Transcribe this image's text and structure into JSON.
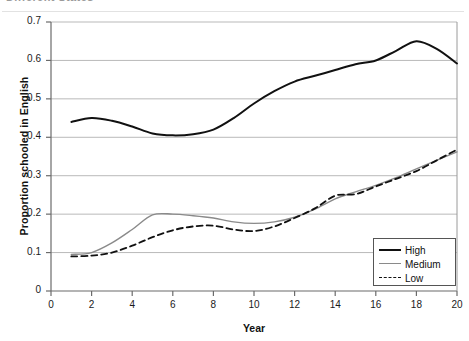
{
  "header": {
    "clipped_title": "Different States"
  },
  "legend": {
    "position": "bottom-right",
    "entries": [
      {
        "label": "High",
        "style": "solid-thick",
        "color": "#111111"
      },
      {
        "label": "Medium",
        "style": "solid-thin",
        "color": "#8a8a8a"
      },
      {
        "label": "Low",
        "style": "dashed",
        "color": "#111111"
      }
    ]
  },
  "axes": {
    "y_ticks": [
      "0.7",
      "0.6",
      "0.5",
      "0.4",
      "0.3",
      "0.2",
      "0.1",
      "0"
    ],
    "x_ticks": [
      "0",
      "2",
      "4",
      "6",
      "8",
      "10",
      "12",
      "14",
      "16",
      "18",
      "20"
    ]
  },
  "chart_data": {
    "type": "line",
    "title": "",
    "xlabel": "Year",
    "ylabel": "Proportion schooled in English",
    "xlim": [
      0,
      20
    ],
    "ylim": [
      0,
      0.7
    ],
    "ytick_step": 0.1,
    "xtick_step": 2,
    "grid": "horizontal",
    "legend_position": "bottom-right",
    "x": [
      1,
      2,
      3,
      4,
      5,
      6,
      7,
      8,
      9,
      10,
      11,
      12,
      13,
      14,
      15,
      16,
      17,
      18,
      19,
      20
    ],
    "series": [
      {
        "name": "High",
        "color": "#111111",
        "style": "solid",
        "width": 2,
        "values": [
          0.44,
          0.45,
          0.443,
          0.428,
          0.41,
          0.405,
          0.408,
          0.42,
          0.45,
          0.488,
          0.52,
          0.545,
          0.56,
          0.575,
          0.59,
          0.6,
          0.625,
          0.65,
          0.63,
          0.592
        ]
      },
      {
        "name": "Medium",
        "color": "#8a8a8a",
        "style": "solid",
        "width": 1.4,
        "values": [
          0.095,
          0.1,
          0.125,
          0.16,
          0.198,
          0.2,
          0.196,
          0.19,
          0.18,
          0.176,
          0.18,
          0.192,
          0.213,
          0.24,
          0.258,
          0.275,
          0.295,
          0.318,
          0.34,
          0.362
        ]
      },
      {
        "name": "Low",
        "color": "#111111",
        "style": "dashed",
        "width": 1.8,
        "values": [
          0.09,
          0.092,
          0.1,
          0.118,
          0.14,
          0.158,
          0.168,
          0.17,
          0.16,
          0.156,
          0.168,
          0.19,
          0.215,
          0.248,
          0.252,
          0.272,
          0.292,
          0.312,
          0.34,
          0.368
        ]
      }
    ]
  }
}
